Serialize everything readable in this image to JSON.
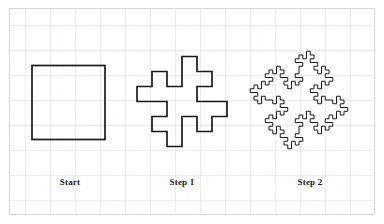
{
  "figure": {
    "background_color": "#ffffff",
    "border_color": "#d7d7d7",
    "stroke_color": "#1a1a1a",
    "grid": {
      "major_color": "#d9d9d9",
      "minor_color": "#e9e9e9",
      "major_spacing_px": 25,
      "minor_spacing_px": 12.5,
      "visible": true
    }
  },
  "panels": [
    {
      "key": "start",
      "label": "Start",
      "label_x": 70,
      "label_y": 177,
      "shape": "square",
      "iteration": 0,
      "segments": 4,
      "bounds": {
        "x": 32,
        "y": 65,
        "width": 73,
        "height": 75
      }
    },
    {
      "key": "step1",
      "label": "Step 1",
      "label_x": 182,
      "label_y": 177,
      "shape": "quadratic-koch-island",
      "iteration": 1,
      "segments": 32,
      "bounds": {
        "x": 122,
        "y": 41,
        "width": 120,
        "height": 121
      }
    },
    {
      "key": "step2",
      "label": "Step 2",
      "label_x": 310,
      "label_y": 177,
      "shape": "quadratic-koch-island",
      "iteration": 2,
      "segments": 256,
      "bounds": {
        "x": 240,
        "y": 34,
        "width": 118,
        "height": 132
      }
    }
  ],
  "geometry": {
    "koch_rule": "each segment -> 8 segments of 1/4 length with an outward square bump and inward square notch",
    "start_square": {
      "cx": 68.5,
      "cy": 102.5,
      "side": 74
    },
    "step1": {
      "cx": 182,
      "cy": 101.5,
      "base_side": 60,
      "unit": 15
    },
    "step2": {
      "cx": 299,
      "cy": 100,
      "base_side": 60,
      "unit": 3.75
    }
  },
  "labels": {
    "start": "Start",
    "step1": "Step 1",
    "step2": "Step 2"
  }
}
